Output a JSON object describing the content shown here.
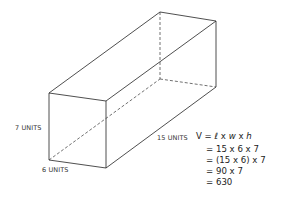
{
  "diagram": {
    "shape": "rectangular prism",
    "labels": {
      "height": "7 UNITS",
      "width": "6 UNITS",
      "length": "15 UNITS"
    },
    "formula": {
      "lhs": "V =",
      "l": "ℓ",
      "x1": "x",
      "w": "w",
      "x2": "x",
      "h": "h"
    },
    "steps": [
      "= 15 x 6 x 7",
      "= (15 x 6) x 7",
      "= 90 x 7",
      "= 630"
    ]
  }
}
